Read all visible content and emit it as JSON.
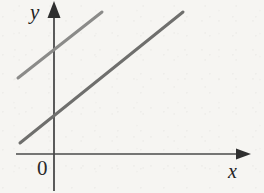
{
  "figure": {
    "width": 264,
    "height": 193,
    "background_color": "#f6f5f2",
    "y_axis_label": "y",
    "x_axis_label": "x",
    "origin_label": "0"
  },
  "chart_data": {
    "type": "line",
    "title": "",
    "subtitle": "",
    "xlabel": "x",
    "ylabel": "y",
    "origin_label": "0",
    "grid": false,
    "legend": null,
    "axis_style": {
      "x_axis_color": "#4a4a4a",
      "y_axis_color": "#4a4a4a",
      "arrowheads": "both-axes-positive-direction",
      "x_axis_pixel_y": 154,
      "y_axis_pixel_x": 54,
      "x_axis_pixel_range": [
        16,
        250
      ],
      "y_axis_pixel_range": [
        2,
        190
      ]
    },
    "series": [
      {
        "name": "upper-line",
        "color": "#8b8b89",
        "line_width": 3,
        "pixel_start": [
          18,
          78
        ],
        "pixel_end": [
          102,
          12
        ],
        "y_intercept_pixel": [
          54,
          51
        ],
        "slope_sign": "positive",
        "description": "upper parallel line segment, crosses the y-axis above the origin"
      },
      {
        "name": "lower-line",
        "color": "#6f6f6d",
        "line_width": 3,
        "pixel_start": [
          20,
          143
        ],
        "pixel_end": [
          183,
          12
        ],
        "y_intercept_pixel": [
          54,
          115
        ],
        "slope_sign": "positive",
        "description": "lower parallel line segment, crosses the y-axis nearer the origin"
      }
    ],
    "annotations": []
  }
}
